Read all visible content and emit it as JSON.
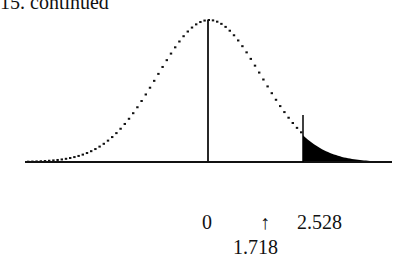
{
  "header": {
    "text": "15. continued"
  },
  "diagram": {
    "type": "normal-distribution-curve",
    "center_label": "0",
    "arrow_symbol": "↑",
    "arrow_label": "1.718",
    "shaded_start_label": "2.528",
    "shaded_region": "right-tail",
    "colors": {
      "curve": "#111111",
      "shade": "#000000",
      "background": "#ffffff"
    }
  }
}
